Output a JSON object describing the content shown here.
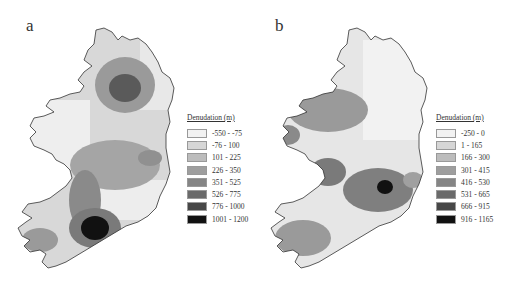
{
  "figure": {
    "panels": [
      {
        "label": "a",
        "legend": {
          "title": "Denudation (m)",
          "classes": [
            {
              "range": "-550 - -75",
              "color": "#f2f2f2"
            },
            {
              "range": "-76 - 100",
              "color": "#d6d6d6"
            },
            {
              "range": "101 - 225",
              "color": "#bcbcbc"
            },
            {
              "range": "226 - 350",
              "color": "#9e9e9e"
            },
            {
              "range": "351 - 525",
              "color": "#858585"
            },
            {
              "range": "526 - 775",
              "color": "#6a6a6a"
            },
            {
              "range": "776 - 1000",
              "color": "#474747"
            },
            {
              "range": "1001 - 1200",
              "color": "#111111"
            }
          ]
        }
      },
      {
        "label": "b",
        "legend": {
          "title": "Denudation (m)",
          "classes": [
            {
              "range": "-250 - 0",
              "color": "#f2f2f2"
            },
            {
              "range": "1 - 165",
              "color": "#d6d6d6"
            },
            {
              "range": "166 - 300",
              "color": "#bcbcbc"
            },
            {
              "range": "301 - 415",
              "color": "#9e9e9e"
            },
            {
              "range": "416 - 530",
              "color": "#858585"
            },
            {
              "range": "531 - 665",
              "color": "#6a6a6a"
            },
            {
              "range": "666 - 915",
              "color": "#474747"
            },
            {
              "range": "916 - 1165",
              "color": "#111111"
            }
          ]
        }
      }
    ]
  }
}
